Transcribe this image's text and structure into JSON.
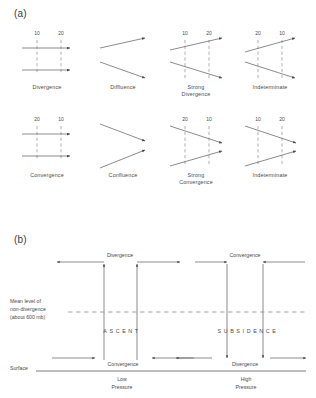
{
  "figure": {
    "panel_a_letter": "(a)",
    "panel_b_letter": "(b)"
  },
  "panel_a": {
    "cells": [
      {
        "id": "divergence",
        "caption_line1": "Divergence",
        "caption_line2": "",
        "isolabels": [
          "10",
          "20"
        ],
        "pattern": "parallel-spreading"
      },
      {
        "id": "diffluence",
        "caption_line1": "Diffluence",
        "caption_line2": "",
        "isolabels": [],
        "pattern": "splaying"
      },
      {
        "id": "strong-divergence",
        "caption_line1": "Strong",
        "caption_line2": "Divergence",
        "isolabels": [
          "10",
          "20"
        ],
        "pattern": "splaying-with-isolines"
      },
      {
        "id": "indeterminate-top",
        "caption_line1": "Indeterminate",
        "caption_line2": "",
        "isolabels": [
          "20",
          "10"
        ],
        "pattern": "splaying-with-isolines-reversed"
      },
      {
        "id": "convergence",
        "caption_line1": "Convergence",
        "caption_line2": "",
        "isolabels": [
          "20",
          "10"
        ],
        "pattern": "parallel-closing"
      },
      {
        "id": "confluence",
        "caption_line1": "Confluence",
        "caption_line2": "",
        "isolabels": [],
        "pattern": "converging"
      },
      {
        "id": "strong-convergence",
        "caption_line1": "Strong",
        "caption_line2": "Convergence",
        "isolabels": [
          "20",
          "10"
        ],
        "pattern": "converging-with-isolines"
      },
      {
        "id": "indeterminate-bottom",
        "caption_line1": "Indeterminate",
        "caption_line2": "",
        "isolabels": [
          "10",
          "20"
        ],
        "pattern": "converging-with-isolines-reversed"
      }
    ]
  },
  "panel_b": {
    "upper_left_label": "Divergence",
    "upper_right_label": "Convergence",
    "mean_level_line1": "Mean level of",
    "mean_level_line2": "non-divergence",
    "mean_level_line3": "(about 600 mb)",
    "ascent_label": "ASCENT",
    "subsidence_label": "SUBSIDENCE",
    "lower_left_label": "Convergence",
    "lower_right_label": "Divergence",
    "surface_label": "Surface",
    "low_pressure_line1": "Low",
    "low_pressure_line2": "Pressure",
    "high_pressure_line1": "High",
    "high_pressure_line2": "Pressure"
  },
  "colors": {
    "line": "#5a5a5a",
    "dashed": "#8c8c8c",
    "text": "#4a4a4a",
    "background": "#ffffff"
  }
}
